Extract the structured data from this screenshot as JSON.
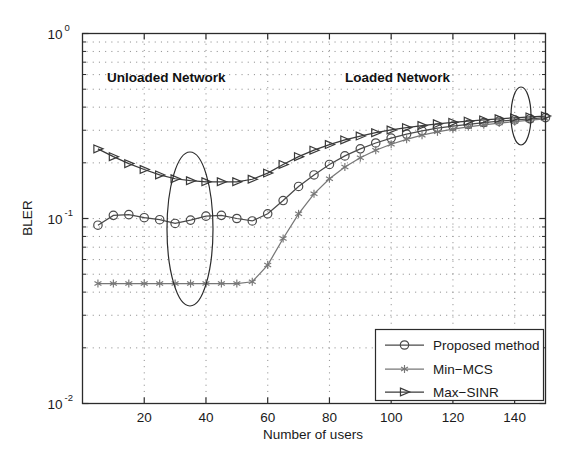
{
  "chart_data": {
    "type": "line",
    "title": "",
    "xlabel": "Number of users",
    "ylabel": "BLER",
    "xlim": [
      0,
      150
    ],
    "ylim": [
      0.01,
      1
    ],
    "yscale": "log",
    "grid": true,
    "legend_position": "lower right",
    "xticks": [
      20,
      40,
      60,
      80,
      100,
      120,
      140
    ],
    "xticklabels": [
      "20",
      "40",
      "60",
      "80",
      "100",
      "120",
      "140"
    ],
    "yticks": [
      0.01,
      0.1,
      1
    ],
    "yticklabels": [
      "10-2",
      "10-1",
      "100"
    ],
    "ytick_bases": [
      "10",
      "10",
      "10"
    ],
    "ytick_exponents": [
      "-2",
      "-1",
      "0"
    ],
    "x": [
      5,
      10,
      15,
      20,
      25,
      30,
      35,
      40,
      45,
      50,
      55,
      60,
      65,
      70,
      75,
      80,
      85,
      90,
      95,
      100,
      105,
      110,
      115,
      120,
      125,
      130,
      135,
      140,
      145,
      150
    ],
    "series": [
      {
        "name": "Proposed method",
        "marker": "circle",
        "color": "#4a4a4a",
        "values": [
          0.092,
          0.104,
          0.105,
          0.101,
          0.0985,
          0.094,
          0.098,
          0.103,
          0.104,
          0.1,
          0.097,
          0.106,
          0.125,
          0.149,
          0.172,
          0.196,
          0.218,
          0.238,
          0.256,
          0.272,
          0.286,
          0.298,
          0.308,
          0.316,
          0.323,
          0.33,
          0.336,
          0.341,
          0.346,
          0.351
        ]
      },
      {
        "name": "Min-MCS",
        "marker": "asterisk",
        "color": "#777777",
        "values": [
          0.0445,
          0.0445,
          0.0445,
          0.0445,
          0.0445,
          0.0445,
          0.0445,
          0.0445,
          0.0445,
          0.0445,
          0.0455,
          0.056,
          0.078,
          0.106,
          0.136,
          0.164,
          0.19,
          0.213,
          0.234,
          0.252,
          0.268,
          0.282,
          0.294,
          0.304,
          0.313,
          0.321,
          0.328,
          0.334,
          0.34,
          0.346
        ]
      },
      {
        "name": "Max-SINR",
        "marker": "triangle",
        "color": "#3a3a3a",
        "values": [
          0.238,
          0.216,
          0.198,
          0.184,
          0.172,
          0.164,
          0.16,
          0.158,
          0.158,
          0.158,
          0.163,
          0.176,
          0.196,
          0.216,
          0.234,
          0.251,
          0.266,
          0.279,
          0.291,
          0.301,
          0.31,
          0.318,
          0.325,
          0.331,
          0.336,
          0.341,
          0.346,
          0.35,
          0.354,
          0.358
        ]
      }
    ],
    "annotations": [
      {
        "text": "Unloaded Network",
        "x_px": 107,
        "y_px": 82
      },
      {
        "text": "Loaded Network",
        "x_px": 345,
        "y_px": 82
      }
    ],
    "highlight_ellipses": [
      {
        "cx_px": 190,
        "cy_px": 229,
        "rx_px": 23,
        "ry_px": 77
      },
      {
        "cx_px": 521,
        "cy_px": 116,
        "rx_px": 10,
        "ry_px": 29
      }
    ]
  }
}
